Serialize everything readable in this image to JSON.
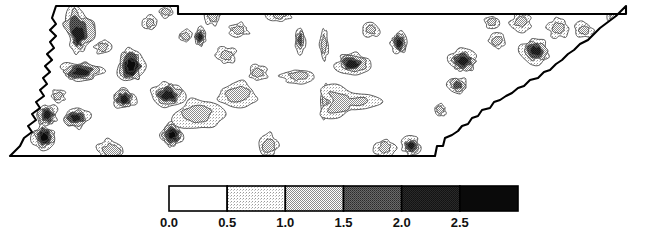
{
  "figure": {
    "title": "",
    "type": "contour-map",
    "region": "Tennessee",
    "background_color": "#ffffff",
    "outline_color": "#000000",
    "contour_line_color": "#4a4a4a"
  },
  "legend": {
    "name": "grayscale-contour-legend",
    "orientation": "horizontal",
    "x": 169,
    "y": 6,
    "width": 349,
    "height": 25,
    "border_color": "#000000",
    "tick_labels": [
      "0.0",
      "0.5",
      "1.0",
      "1.5",
      "2.0",
      "2.5"
    ],
    "tick_values": [
      0.0,
      0.5,
      1.0,
      1.5,
      2.0,
      2.5
    ],
    "bands": [
      {
        "label": "0.0-0.5",
        "from": 0.0,
        "to": 0.5,
        "color": "#ffffff",
        "fill": "none"
      },
      {
        "label": "0.5-1.0",
        "from": 0.5,
        "to": 1.0,
        "color": "#d8d8d8",
        "fill": "dither-light"
      },
      {
        "label": "1.0-1.5",
        "from": 1.0,
        "to": 1.5,
        "color": "#a8a8a8",
        "fill": "dither-medium"
      },
      {
        "label": "1.5-2.0",
        "from": 1.5,
        "to": 2.0,
        "color": "#6e6e6e",
        "fill": "dither-dark"
      },
      {
        "label": "2.0-2.5",
        "from": 2.0,
        "to": 2.5,
        "color": "#3a3a3a",
        "fill": "dither-darker"
      },
      {
        "label": "2.5+",
        "from": 2.5,
        "to": null,
        "color": "#0a0a0a",
        "fill": "solid-black"
      }
    ]
  },
  "chart_data": {
    "type": "heatmap",
    "subtype": "filled-contour-map",
    "title": "",
    "xlabel": "",
    "ylabel": "",
    "legend_position": "bottom",
    "grid": false,
    "units": "",
    "contour_levels": [
      0.5,
      1.0,
      1.5,
      2.0,
      2.5
    ],
    "value_range": [
      0.0,
      3.0
    ],
    "colorbar_categories": [
      "0.0",
      "0.5",
      "1.0",
      "1.5",
      "2.0",
      "2.5"
    ],
    "colorbar_values": [
      0.0,
      0.5,
      1.0,
      1.5,
      2.0,
      2.5
    ],
    "state_outline": "M 52,18 L 56,24 L 50,30 L 56,36 L 50,42 L 54,48 L 47,54 L 52,60 L 45,66 L 50,72 L 43,78 L 47,84 L 40,90 L 44,96 L 36,102 L 40,108 L 32,114 L 36,120 L 28,126 L 32,132 L 24,138 L 20,146 L 14,152 L 10,156 L 435,156 L 437,146 L 443,146 L 445,138 L 452,135 L 458,131 L 462,126 L 468,124 L 472,118 L 478,116 L 482,110 L 490,108 L 494,102 L 500,100 L 506,96 L 512,93 L 518,88 L 524,86 L 530,80 L 538,78 L 544,72 L 550,70 L 556,64 L 562,60 L 568,54 L 574,50 L 580,44 L 588,40 L 594,34 L 600,28 L 608,22 L 616,16 L 622,10 L 626,6 L 626,14 L 178,14 L 178,6 L 56,6 Z",
    "hotspots": [
      {
        "cx": 78,
        "cy": 38,
        "rx": 14,
        "ry": 26,
        "peak": 2.0,
        "shape": "wedge"
      },
      {
        "cx": 131,
        "cy": 66,
        "rx": 13,
        "ry": 17,
        "peak": 2.6,
        "shape": "blob"
      },
      {
        "cx": 81,
        "cy": 72,
        "rx": 20,
        "ry": 10,
        "peak": 2.0,
        "shape": "ellipse"
      },
      {
        "cx": 47,
        "cy": 115,
        "rx": 10,
        "ry": 11,
        "peak": 2.2,
        "shape": "blob"
      },
      {
        "cx": 44,
        "cy": 137,
        "rx": 11,
        "ry": 12,
        "peak": 2.6,
        "shape": "blob"
      },
      {
        "cx": 76,
        "cy": 118,
        "rx": 13,
        "ry": 10,
        "peak": 2.0,
        "shape": "blob"
      },
      {
        "cx": 124,
        "cy": 99,
        "rx": 11,
        "ry": 10,
        "peak": 2.0,
        "shape": "blob"
      },
      {
        "cx": 172,
        "cy": 135,
        "rx": 11,
        "ry": 11,
        "peak": 2.6,
        "shape": "blob"
      },
      {
        "cx": 168,
        "cy": 95,
        "rx": 16,
        "ry": 12,
        "peak": 2.3,
        "shape": "blob"
      },
      {
        "cx": 200,
        "cy": 37,
        "rx": 6,
        "ry": 9,
        "peak": 2.0,
        "shape": "blob"
      },
      {
        "cx": 238,
        "cy": 94,
        "rx": 20,
        "ry": 12,
        "peak": 1.2,
        "shape": "blob"
      },
      {
        "cx": 300,
        "cy": 40,
        "rx": 5,
        "ry": 12,
        "peak": 1.6,
        "shape": "streak"
      },
      {
        "cx": 324,
        "cy": 45,
        "rx": 4,
        "ry": 16,
        "peak": 1.2,
        "shape": "streak"
      },
      {
        "cx": 325,
        "cy": 100,
        "rx": 4,
        "ry": 18,
        "peak": 1.2,
        "shape": "streak"
      },
      {
        "cx": 352,
        "cy": 64,
        "rx": 16,
        "ry": 10,
        "peak": 2.0,
        "shape": "blob"
      },
      {
        "cx": 399,
        "cy": 43,
        "rx": 8,
        "ry": 11,
        "peak": 2.2,
        "shape": "blob"
      },
      {
        "cx": 411,
        "cy": 146,
        "rx": 9,
        "ry": 9,
        "peak": 2.4,
        "shape": "blob"
      },
      {
        "cx": 463,
        "cy": 61,
        "rx": 14,
        "ry": 11,
        "peak": 2.2,
        "shape": "blob"
      },
      {
        "cx": 458,
        "cy": 85,
        "rx": 10,
        "ry": 8,
        "peak": 1.6,
        "shape": "blob"
      },
      {
        "cx": 535,
        "cy": 51,
        "rx": 14,
        "ry": 12,
        "peak": 2.3,
        "shape": "blob"
      },
      {
        "cx": 521,
        "cy": 22,
        "rx": 10,
        "ry": 9,
        "peak": 1.2,
        "shape": "blob"
      },
      {
        "cx": 584,
        "cy": 30,
        "rx": 9,
        "ry": 8,
        "peak": 1.2,
        "shape": "blob"
      },
      {
        "cx": 622,
        "cy": 48,
        "rx": 11,
        "ry": 24,
        "peak": 2.4,
        "shape": "blob"
      },
      {
        "cx": 614,
        "cy": 18,
        "rx": 6,
        "ry": 6,
        "peak": 1.2,
        "shape": "blob"
      },
      {
        "cx": 279,
        "cy": 13,
        "rx": 12,
        "ry": 9,
        "peak": 1.2,
        "shape": "blob"
      },
      {
        "cx": 213,
        "cy": 17,
        "rx": 8,
        "ry": 8,
        "peak": 1.2,
        "shape": "blob"
      },
      {
        "cx": 239,
        "cy": 30,
        "rx": 10,
        "ry": 7,
        "peak": 1.2,
        "shape": "blob"
      },
      {
        "cx": 150,
        "cy": 23,
        "rx": 7,
        "ry": 7,
        "peak": 1.2,
        "shape": "blob"
      },
      {
        "cx": 166,
        "cy": 12,
        "rx": 7,
        "ry": 6,
        "peak": 1.2,
        "shape": "blob"
      },
      {
        "cx": 226,
        "cy": 55,
        "rx": 10,
        "ry": 8,
        "peak": 1.2,
        "shape": "blob"
      },
      {
        "cx": 298,
        "cy": 76,
        "rx": 16,
        "ry": 7,
        "peak": 1.2,
        "shape": "blob"
      },
      {
        "cx": 345,
        "cy": 102,
        "rx": 28,
        "ry": 14,
        "peak": 1.2,
        "shape": "crown"
      },
      {
        "cx": 197,
        "cy": 115,
        "rx": 24,
        "ry": 14,
        "peak": 1.2,
        "shape": "blob"
      },
      {
        "cx": 268,
        "cy": 146,
        "rx": 10,
        "ry": 12,
        "peak": 1.2,
        "shape": "blob"
      },
      {
        "cx": 385,
        "cy": 148,
        "rx": 10,
        "ry": 9,
        "peak": 1.2,
        "shape": "blob"
      },
      {
        "cx": 440,
        "cy": 110,
        "rx": 6,
        "ry": 6,
        "peak": 1.2,
        "shape": "blob"
      },
      {
        "cx": 492,
        "cy": 22,
        "rx": 7,
        "ry": 6,
        "peak": 1.2,
        "shape": "blob"
      },
      {
        "cx": 558,
        "cy": 28,
        "rx": 10,
        "ry": 10,
        "peak": 1.2,
        "shape": "blob"
      },
      {
        "cx": 497,
        "cy": 41,
        "rx": 8,
        "ry": 8,
        "peak": 1.2,
        "shape": "blob"
      },
      {
        "cx": 103,
        "cy": 47,
        "rx": 8,
        "ry": 7,
        "peak": 1.2,
        "shape": "blob"
      },
      {
        "cx": 58,
        "cy": 96,
        "rx": 7,
        "ry": 7,
        "peak": 1.2,
        "shape": "blob"
      },
      {
        "cx": 185,
        "cy": 36,
        "rx": 7,
        "ry": 6,
        "peak": 1.2,
        "shape": "blob"
      },
      {
        "cx": 258,
        "cy": 73,
        "rx": 9,
        "ry": 8,
        "peak": 1.2,
        "shape": "blob"
      },
      {
        "cx": 371,
        "cy": 30,
        "rx": 8,
        "ry": 7,
        "peak": 1.2,
        "shape": "blob"
      },
      {
        "cx": 20,
        "cy": 120,
        "rx": 10,
        "ry": 9,
        "peak": 1.2,
        "shape": "blob"
      },
      {
        "cx": 111,
        "cy": 150,
        "rx": 14,
        "ry": 10,
        "peak": 1.2,
        "shape": "blob"
      }
    ]
  }
}
